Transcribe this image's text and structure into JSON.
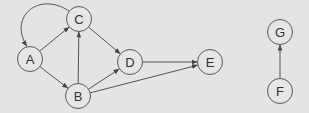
{
  "colors": {
    "background": "#e4e4e4",
    "node_fill": "#e6e6e6",
    "stroke": "#555555",
    "label": "#333333"
  },
  "nodes": [
    {
      "id": "A",
      "label": "A",
      "x": 30,
      "y": 59
    },
    {
      "id": "B",
      "label": "B",
      "x": 78,
      "y": 96
    },
    {
      "id": "C",
      "label": "C",
      "x": 79,
      "y": 19
    },
    {
      "id": "D",
      "label": "D",
      "x": 130,
      "y": 62
    },
    {
      "id": "E",
      "label": "E",
      "x": 210,
      "y": 62
    },
    {
      "id": "F",
      "label": "F",
      "x": 280,
      "y": 91
    },
    {
      "id": "G",
      "label": "G",
      "x": 280,
      "y": 32
    }
  ],
  "edges": [
    {
      "from": "A",
      "to": "C"
    },
    {
      "from": "C",
      "to": "A",
      "curved": true
    },
    {
      "from": "A",
      "to": "B"
    },
    {
      "from": "B",
      "to": "C"
    },
    {
      "from": "C",
      "to": "D"
    },
    {
      "from": "B",
      "to": "D"
    },
    {
      "from": "D",
      "to": "E"
    },
    {
      "from": "B",
      "to": "E"
    },
    {
      "from": "F",
      "to": "G"
    }
  ]
}
